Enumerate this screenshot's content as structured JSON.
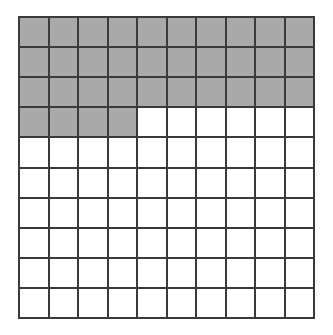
{
  "diagram": {
    "type": "hundred-grid",
    "rows": 10,
    "columns": 10,
    "total_cells": 100,
    "shaded_cells": 34,
    "shaded_color": "#a9a9a9",
    "unshaded_color": "#ffffff",
    "line_color": "#3a3a3a",
    "shaded_rows_full": [
      1,
      2,
      3
    ],
    "partial_row": {
      "row": 4,
      "shaded_count": 4
    }
  }
}
